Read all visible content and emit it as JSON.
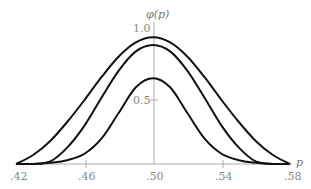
{
  "chart_data": {
    "type": "line",
    "title": "",
    "xlabel": "p",
    "ylabel": "φ(p)",
    "xlim": [
      0.42,
      0.58
    ],
    "ylim": [
      0,
      1.0
    ],
    "grid": false,
    "legend": null,
    "x_ticks": [
      ".42",
      ".46",
      ".50",
      ".54",
      ".58"
    ],
    "y_ticks": [
      "0.5",
      "1.0"
    ],
    "x": [
      0.42,
      0.43,
      0.44,
      0.45,
      0.46,
      0.47,
      0.48,
      0.49,
      0.5,
      0.51,
      0.52,
      0.53,
      0.54,
      0.55,
      0.56,
      0.57,
      0.58
    ],
    "series": [
      {
        "name": "outer curve",
        "values": [
          0.0,
          0.07,
          0.18,
          0.33,
          0.5,
          0.68,
          0.84,
          0.95,
          0.99,
          0.95,
          0.84,
          0.68,
          0.5,
          0.33,
          0.18,
          0.07,
          0.0
        ]
      },
      {
        "name": "middle curve",
        "values": [
          0.0,
          0.0,
          0.02,
          0.13,
          0.3,
          0.52,
          0.73,
          0.88,
          0.93,
          0.88,
          0.73,
          0.52,
          0.3,
          0.13,
          0.02,
          0.0,
          0.0
        ]
      },
      {
        "name": "inner curve",
        "values": [
          0.0,
          0.0,
          0.01,
          0.03,
          0.08,
          0.2,
          0.4,
          0.6,
          0.67,
          0.6,
          0.4,
          0.2,
          0.08,
          0.03,
          0.01,
          0.0,
          0.0
        ]
      }
    ]
  },
  "labels": {
    "ylabel": "φ(p)",
    "xlabel": "p",
    "y_tick_1": "1.0",
    "y_tick_05": "0.5",
    "x_tick_42": ".42",
    "x_tick_46": ".46",
    "x_tick_50": ".50",
    "x_tick_54": ".54",
    "x_tick_58": ".58"
  }
}
